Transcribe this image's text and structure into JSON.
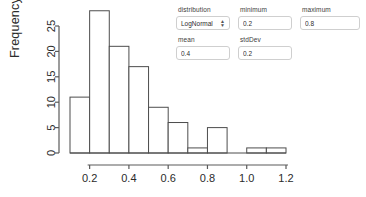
{
  "controls": {
    "distribution": {
      "label": "distribution",
      "value": "LogNormal",
      "options": [
        "LogNormal",
        "Normal",
        "Uniform",
        "Exponential"
      ],
      "caret_icon": "chevron-updown-icon"
    },
    "minimum": {
      "label": "minimum",
      "value": "0.2",
      "placeholder": "min"
    },
    "maximum": {
      "label": "maximum",
      "value": "0.8",
      "placeholder": "max"
    },
    "mean": {
      "label": "mean",
      "value": "0.4",
      "placeholder": "mean"
    },
    "stdDev": {
      "label": "stdDev",
      "value": "0.2",
      "placeholder": "sd"
    }
  },
  "colors": {
    "axis": "#5a5a5a",
    "bar_stroke": "#4d4d4d",
    "bar_fill": "#ffffff",
    "text": "#2b2b2b",
    "field_border": "#cfcfcf",
    "background": "#ffffff"
  },
  "chart_data": {
    "type": "bar",
    "title": "",
    "subtitle": "",
    "xlabel": "",
    "ylabel": "Frequency",
    "grid": false,
    "legend": false,
    "bin_width": 0.1,
    "xlim": [
      0.1,
      1.2
    ],
    "ylim": [
      0,
      28
    ],
    "xticks": [
      "0.2",
      "0.4",
      "0.6",
      "0.8",
      "1.0",
      "1.2"
    ],
    "xtick_values": [
      0.2,
      0.4,
      0.6,
      0.8,
      1.0,
      1.2
    ],
    "yticks": [
      "0",
      "5",
      "10",
      "15",
      "20",
      "25"
    ],
    "ytick_values": [
      0,
      5,
      10,
      15,
      20,
      25
    ],
    "bins": [
      {
        "x0": 0.1,
        "x1": 0.2,
        "value": 11
      },
      {
        "x0": 0.2,
        "x1": 0.3,
        "value": 28
      },
      {
        "x0": 0.3,
        "x1": 0.4,
        "value": 21
      },
      {
        "x0": 0.4,
        "x1": 0.5,
        "value": 17
      },
      {
        "x0": 0.5,
        "x1": 0.6,
        "value": 9
      },
      {
        "x0": 0.6,
        "x1": 0.7,
        "value": 6
      },
      {
        "x0": 0.7,
        "x1": 0.8,
        "value": 1
      },
      {
        "x0": 0.8,
        "x1": 0.9,
        "value": 5
      },
      {
        "x0": 0.9,
        "x1": 1.0,
        "value": 0
      },
      {
        "x0": 1.0,
        "x1": 1.1,
        "value": 1
      },
      {
        "x0": 1.1,
        "x1": 1.2,
        "value": 1
      }
    ],
    "categories": [
      "0.1-0.2",
      "0.2-0.3",
      "0.3-0.4",
      "0.4-0.5",
      "0.5-0.6",
      "0.6-0.7",
      "0.7-0.8",
      "0.8-0.9",
      "0.9-1.0",
      "1.0-1.1",
      "1.1-1.2"
    ],
    "values": [
      11,
      28,
      21,
      17,
      9,
      6,
      1,
      5,
      0,
      1,
      1
    ]
  }
}
